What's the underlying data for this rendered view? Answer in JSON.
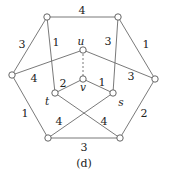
{
  "caption": "(d)",
  "nodes": [
    {
      "id": "a",
      "x": 47,
      "y": 17,
      "label": ""
    },
    {
      "id": "b",
      "x": 118,
      "y": 17,
      "label": ""
    },
    {
      "id": "c",
      "x": 12,
      "y": 75,
      "label": ""
    },
    {
      "id": "d",
      "x": 155,
      "y": 79,
      "label": ""
    },
    {
      "id": "e",
      "x": 48,
      "y": 138,
      "label": ""
    },
    {
      "id": "f",
      "x": 120,
      "y": 138,
      "label": ""
    },
    {
      "id": "u",
      "x": 83,
      "y": 50,
      "label": "u",
      "lx": 81,
      "ly": 41
    },
    {
      "id": "v",
      "x": 83,
      "y": 79,
      "label": "v",
      "lx": 83,
      "ly": 87
    },
    {
      "id": "t",
      "x": 55,
      "y": 93,
      "label": "t",
      "lx": 47,
      "ly": 101
    },
    {
      "id": "s",
      "x": 113,
      "y": 93,
      "label": "s",
      "lx": 121,
      "ly": 102
    }
  ],
  "edges": [
    {
      "from": "a",
      "to": "b",
      "weight": "4",
      "lx": 82,
      "ly": 10
    },
    {
      "from": "a",
      "to": "c",
      "weight": "3",
      "lx": 22,
      "ly": 44
    },
    {
      "from": "b",
      "to": "d",
      "weight": "1",
      "lx": 146,
      "ly": 44
    },
    {
      "from": "c",
      "to": "e",
      "weight": "1",
      "lx": 25,
      "ly": 113
    },
    {
      "from": "d",
      "to": "f",
      "weight": "2",
      "lx": 144,
      "ly": 113
    },
    {
      "from": "e",
      "to": "f",
      "weight": "3",
      "lx": 84,
      "ly": 147
    },
    {
      "from": "a",
      "to": "t",
      "weight": "1",
      "lx": 56,
      "ly": 42
    },
    {
      "from": "b",
      "to": "s",
      "weight": "3",
      "lx": 108,
      "ly": 41
    },
    {
      "from": "c",
      "to": "u",
      "weight": "4",
      "lx": 34,
      "ly": 78
    },
    {
      "from": "u",
      "to": "d",
      "weight": "3",
      "lx": 131,
      "ly": 76
    },
    {
      "from": "u",
      "to": "v",
      "weight": "",
      "dashed": true
    },
    {
      "from": "v",
      "to": "t",
      "weight": "2",
      "lx": 63,
      "ly": 83
    },
    {
      "from": "v",
      "to": "s",
      "weight": "1",
      "lx": 102,
      "ly": 82
    },
    {
      "from": "t",
      "to": "f",
      "weight": "4",
      "lx": 104,
      "ly": 121
    },
    {
      "from": "s",
      "to": "e",
      "weight": "4",
      "lx": 59,
      "ly": 121
    }
  ]
}
